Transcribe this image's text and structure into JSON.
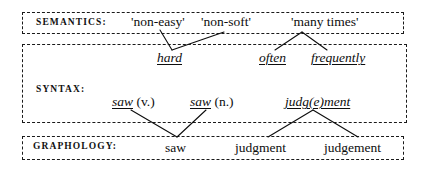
{
  "diagram": {
    "background_color": "#ffffff",
    "ink_color": "#0d0d0d",
    "box_border_style": "dashed"
  },
  "strata": [
    {
      "id": "semantics",
      "label": "SEMANTICS:",
      "items": [
        {
          "id": "sem-0",
          "text": "'non-easy'",
          "style": "roman"
        },
        {
          "id": "sem-1",
          "text": "'non-soft'",
          "style": "roman"
        },
        {
          "id": "sem-2",
          "text": "'many times'",
          "style": "roman"
        }
      ]
    },
    {
      "id": "syntax",
      "label": "SYNTAX:",
      "items": [
        {
          "id": "syn-0",
          "text": "hard",
          "style": "italic-underlined"
        },
        {
          "id": "syn-1",
          "text": "often",
          "style": "italic-underlined"
        },
        {
          "id": "syn-2",
          "text": "frequently",
          "style": "italic-underlined"
        },
        {
          "id": "syn-3",
          "text": "saw",
          "suffix": " (v.)",
          "style": "italic-underlined-with-roman-suffix"
        },
        {
          "id": "syn-4",
          "text": "saw",
          "suffix": " (n.)",
          "style": "italic-underlined-with-roman-suffix"
        },
        {
          "id": "syn-5",
          "text": "judg(e)ment",
          "style": "italic-underlined"
        }
      ]
    },
    {
      "id": "graphology",
      "label": "GRAPHOLOGY:",
      "items": [
        {
          "id": "gra-0",
          "text": "saw",
          "style": "roman"
        },
        {
          "id": "gra-1",
          "text": "judgment",
          "style": "roman"
        },
        {
          "id": "gra-2",
          "text": "judgement",
          "style": "roman"
        }
      ]
    }
  ],
  "connectors": [
    {
      "from": "sem-0",
      "to": "syn-0",
      "x1": 160,
      "y1": 30,
      "x2": 172,
      "y2": 50
    },
    {
      "from": "sem-1",
      "to": "syn-0",
      "x1": 224,
      "y1": 32,
      "x2": 172,
      "y2": 50
    },
    {
      "from": "sem-2",
      "to": "syn-1",
      "x1": 302,
      "y1": 32,
      "x2": 275,
      "y2": 50
    },
    {
      "from": "sem-2",
      "to": "syn-2",
      "x1": 302,
      "y1": 32,
      "x2": 327,
      "y2": 50
    },
    {
      "from": "syn-3",
      "to": "gra-0",
      "x1": 131,
      "y1": 110,
      "x2": 177,
      "y2": 137
    },
    {
      "from": "syn-4",
      "to": "gra-0",
      "x1": 206,
      "y1": 110,
      "x2": 177,
      "y2": 137
    },
    {
      "from": "syn-5",
      "to": "gra-1",
      "x1": 313,
      "y1": 110,
      "x2": 268,
      "y2": 137
    },
    {
      "from": "syn-5",
      "to": "gra-2",
      "x1": 313,
      "y1": 110,
      "x2": 358,
      "y2": 137
    }
  ]
}
